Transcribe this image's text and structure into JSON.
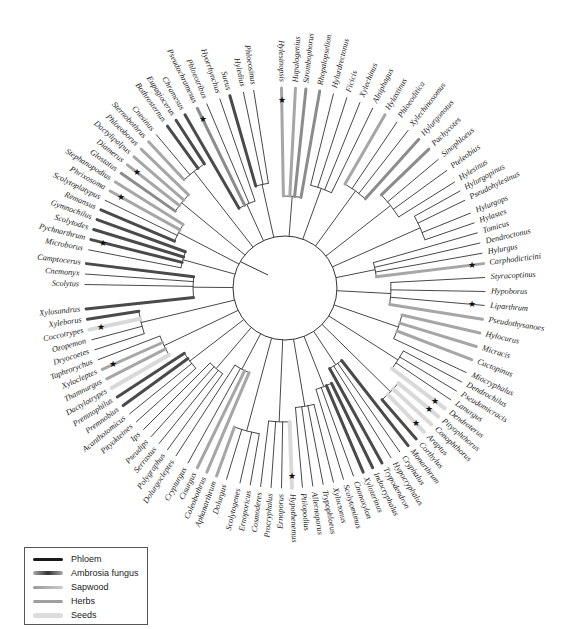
{
  "figure": {
    "type": "circular-phylogenetic-tree"
  },
  "root": {
    "cx": 285,
    "cy": 290,
    "r": 52
  },
  "tips": [
    {
      "name": "Hylesinopsis",
      "angle": -91,
      "substrate": "herbs",
      "star": true
    },
    {
      "name": "Hapalogenius",
      "angle": -87,
      "substrate": "herbs"
    },
    {
      "name": "Strombophorus",
      "angle": -84,
      "substrate": "sapwood"
    },
    {
      "name": "Rhopalopselion",
      "angle": -80,
      "substrate": "sapwood"
    },
    {
      "name": "Hylurdrectonus",
      "angle": -76,
      "substrate": "phloem"
    },
    {
      "name": "Ficicis",
      "angle": -72,
      "substrate": "phloem"
    },
    {
      "name": "Xylechinus",
      "angle": -68,
      "substrate": "phloem"
    },
    {
      "name": "Alniphagus",
      "angle": -64,
      "substrate": "phloem"
    },
    {
      "name": "Hylastinus",
      "angle": -60,
      "substrate": "herbs"
    },
    {
      "name": "Phloeoditica",
      "angle": -56,
      "substrate": "phloem"
    },
    {
      "name": "Xylechinosomus",
      "angle": -52,
      "substrate": "phloem"
    },
    {
      "name": "Hylurgonotus",
      "angle": -48,
      "substrate": "sapwood"
    },
    {
      "name": "Pachycotes",
      "angle": -44,
      "substrate": "sapwood"
    },
    {
      "name": "Sinophloeus",
      "angle": -40,
      "substrate": "phloem"
    },
    {
      "name": "Pteleobius",
      "angle": -36,
      "substrate": "phloem"
    },
    {
      "name": "Hylesinus",
      "angle": -32,
      "substrate": "phloem"
    },
    {
      "name": "Hylurgopinus",
      "angle": -29,
      "substrate": "phloem"
    },
    {
      "name": "Pseudohylesinus",
      "angle": -26,
      "substrate": "phloem"
    },
    {
      "name": "Hylurgops",
      "angle": -22,
      "substrate": "phloem"
    },
    {
      "name": "Hylastes",
      "angle": -19,
      "substrate": "phloem"
    },
    {
      "name": "Tomicus",
      "angle": -16,
      "substrate": "phloem"
    },
    {
      "name": "Dendroctonus",
      "angle": -13,
      "substrate": "phloem"
    },
    {
      "name": "Hylurgus",
      "angle": -10,
      "substrate": "phloem"
    },
    {
      "name": "Carphodicticini",
      "angle": -7,
      "substrate": "herbs",
      "star": true
    },
    {
      "name": "Styracoptinus",
      "angle": -3,
      "substrate": "phloem"
    },
    {
      "name": "Hypoborus",
      "angle": 1,
      "substrate": "phloem"
    },
    {
      "name": "Liparthrum",
      "angle": 5,
      "substrate": "phloem",
      "star": true
    },
    {
      "name": "Pseudothysanoes",
      "angle": 9,
      "substrate": "herbs"
    },
    {
      "name": "Hylocurus",
      "angle": 13,
      "substrate": "herbs"
    },
    {
      "name": "Micracis",
      "angle": 17,
      "substrate": "herbs"
    },
    {
      "name": "Cactopinus",
      "angle": 21,
      "substrate": "herbs"
    },
    {
      "name": "Miocryphalus",
      "angle": 25,
      "substrate": "phloem"
    },
    {
      "name": "Dendrochilus",
      "angle": 28,
      "substrate": "phloem"
    },
    {
      "name": "Pseudomicracis",
      "angle": 31,
      "substrate": "phloem"
    },
    {
      "name": "Lanurgus",
      "angle": 34,
      "substrate": "phloem"
    },
    {
      "name": "Dendroterus",
      "angle": 37,
      "substrate": "seeds",
      "star": true
    },
    {
      "name": "Pityophthorus",
      "angle": 40,
      "substrate": "seeds",
      "star": true
    },
    {
      "name": "Conophthorus",
      "angle": 43,
      "substrate": "seeds"
    },
    {
      "name": "Araptus",
      "angle": 46,
      "substrate": "seeds",
      "star": true
    },
    {
      "name": "Corthylus",
      "angle": 49,
      "substrate": "ambrosia"
    },
    {
      "name": "Monarthrum",
      "angle": 52,
      "substrate": "ambrosia"
    },
    {
      "name": "Cryphalus",
      "angle": 55,
      "substrate": "phloem"
    },
    {
      "name": "Hypocryphalus",
      "angle": 58,
      "substrate": "phloem"
    },
    {
      "name": "Trypodendron",
      "angle": 61,
      "substrate": "ambrosia"
    },
    {
      "name": "Indocryphalus",
      "angle": 64,
      "substrate": "ambrosia"
    },
    {
      "name": "Xyloterinus",
      "angle": 67,
      "substrate": "ambrosia"
    },
    {
      "name": "Cnonoxylon",
      "angle": 70,
      "substrate": "phloem"
    },
    {
      "name": "Scolytomimus",
      "angle": 73,
      "substrate": "phloem"
    },
    {
      "name": "Xyloctonus",
      "angle": 76,
      "substrate": "phloem"
    },
    {
      "name": "Trypophloeus",
      "angle": 79,
      "substrate": "phloem"
    },
    {
      "name": "Allernoporus",
      "angle": 82,
      "substrate": "phloem"
    },
    {
      "name": "Ptilopodius",
      "angle": 85,
      "substrate": "phloem"
    },
    {
      "name": "Hypothenemus",
      "angle": 88,
      "substrate": "seeds",
      "star": true
    },
    {
      "name": "Ernoporus",
      "angle": 91,
      "substrate": "phloem"
    },
    {
      "name": "Procryphalus",
      "angle": 94,
      "substrate": "phloem"
    },
    {
      "name": "Cosmoderes",
      "angle": 97,
      "substrate": "phloem"
    },
    {
      "name": "Ernoporicus",
      "angle": 100,
      "substrate": "phloem"
    },
    {
      "name": "Scolytogenes",
      "angle": 103,
      "substrate": "phloem"
    },
    {
      "name": "Dolurgus",
      "angle": 107,
      "substrate": "phloem"
    },
    {
      "name": "Aphanarthrum",
      "angle": 110,
      "substrate": "herbs"
    },
    {
      "name": "Coleobothrus",
      "angle": 113,
      "substrate": "herbs"
    },
    {
      "name": "Cisurgus",
      "angle": 116,
      "substrate": "herbs"
    },
    {
      "name": "Crypturgus",
      "angle": 119,
      "substrate": "phloem"
    },
    {
      "name": "Dolurgocleptes",
      "angle": 123,
      "substrate": "phloem"
    },
    {
      "name": "Polygraphus",
      "angle": 126,
      "substrate": "phloem"
    },
    {
      "name": "Serrastus",
      "angle": 129,
      "substrate": "phloem"
    },
    {
      "name": "Pseudips",
      "angle": 132,
      "substrate": "phloem"
    },
    {
      "name": "Ips",
      "angle": 135,
      "substrate": "phloem"
    },
    {
      "name": "Pityokteines",
      "angle": 138,
      "substrate": "phloem"
    },
    {
      "name": "Acanthotomicus",
      "angle": 141,
      "substrate": "phloem"
    },
    {
      "name": "Premnobius",
      "angle": 144,
      "substrate": "ambrosia"
    },
    {
      "name": "Premnophilus",
      "angle": 147,
      "substrate": "ambrosia"
    },
    {
      "name": "Dactylotrypes",
      "angle": 150,
      "substrate": "seeds"
    },
    {
      "name": "Thamnurgus",
      "angle": 153,
      "substrate": "herbs"
    },
    {
      "name": "Xylocleptes",
      "angle": 156,
      "substrate": "herbs",
      "star": true
    },
    {
      "name": "Taphrorychus",
      "angle": 159,
      "substrate": "phloem"
    },
    {
      "name": "Dryocoetes",
      "angle": 162,
      "substrate": "phloem"
    },
    {
      "name": "Ozopemon",
      "angle": 165,
      "substrate": "phloem"
    },
    {
      "name": "Coccotrypes",
      "angle": 168,
      "substrate": "seeds",
      "star": true
    },
    {
      "name": "Xyleborus",
      "angle": 171,
      "substrate": "ambrosia"
    },
    {
      "name": "Xylosandrus",
      "angle": 174,
      "substrate": "ambrosia"
    },
    {
      "name": "Scolytus",
      "angle": 181,
      "substrate": "phloem"
    },
    {
      "name": "Cnemonyx",
      "angle": 184,
      "substrate": "phloem"
    },
    {
      "name": "Camptocerus",
      "angle": 187,
      "substrate": "ambrosia"
    },
    {
      "name": "Microborus",
      "angle": 191,
      "substrate": "phloem"
    },
    {
      "name": "Pychnarthrum",
      "angle": 194,
      "substrate": "ambrosia",
      "star": true
    },
    {
      "name": "Scolytodes",
      "angle": 197,
      "substrate": "ambrosia"
    },
    {
      "name": "Gymnochilus",
      "angle": 200,
      "substrate": "ambrosia"
    },
    {
      "name": "Remansus",
      "angle": 203,
      "substrate": "ambrosia"
    },
    {
      "name": "Scolytoplatypus",
      "angle": 206,
      "substrate": "phloem"
    },
    {
      "name": "Phrixosoma",
      "angle": 209,
      "substrate": "herbs",
      "star": true
    },
    {
      "name": "Stephanopodius",
      "angle": 212,
      "substrate": "herbs"
    },
    {
      "name": "Glostatus",
      "angle": 215,
      "substrate": "sapwood"
    },
    {
      "name": "Diamerus",
      "angle": 218,
      "substrate": "herbs",
      "star": true
    },
    {
      "name": "Dactylipalpus",
      "angle": 221,
      "substrate": "herbs"
    },
    {
      "name": "Phloeoborus",
      "angle": 224,
      "substrate": "herbs"
    },
    {
      "name": "Sternobothrus",
      "angle": 227,
      "substrate": "herbs"
    },
    {
      "name": "Cnesinus",
      "angle": 230,
      "substrate": "phloem"
    },
    {
      "name": "Bothrosternus",
      "angle": 234,
      "substrate": "ambrosia"
    },
    {
      "name": "Eupagiocerus",
      "angle": 237,
      "substrate": "ambrosia"
    },
    {
      "name": "Chramesus",
      "angle": 240,
      "substrate": "ambrosia"
    },
    {
      "name": "Pseudochramesus",
      "angle": 244,
      "substrate": "sapwood",
      "star": true
    },
    {
      "name": "Phloeotribus",
      "angle": 247,
      "substrate": "phloem"
    },
    {
      "name": "Hyorrhynchus",
      "angle": 251,
      "substrate": "phloem"
    },
    {
      "name": "Sueus",
      "angle": 254,
      "substrate": "ambrosia"
    },
    {
      "name": "Hyledius",
      "angle": 258,
      "substrate": "phloem"
    },
    {
      "name": "Phloeosinus",
      "angle": 261,
      "substrate": "phloem"
    }
  ],
  "colors": {
    "phloem": "#1a1a1a",
    "ambrosia": "#4a4a4a",
    "sapwood": "#8c8c8c",
    "herbs": "#a6a6a6",
    "seeds": "#d9d9d9",
    "branch": "#333333"
  },
  "legend": {
    "items": [
      {
        "label": "Phloem",
        "key": "phloem"
      },
      {
        "label": "Ambrosia fungus",
        "key": "ambrosia"
      },
      {
        "label": "Sapwood",
        "key": "sapwood"
      },
      {
        "label": "Herbs",
        "key": "herbs"
      },
      {
        "label": "Seeds",
        "key": "seeds"
      }
    ]
  }
}
